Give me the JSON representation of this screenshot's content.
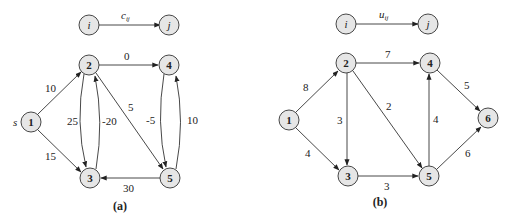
{
  "graph_a": {
    "caption": "(a)",
    "legend": {
      "from": "i",
      "to": "j",
      "label": "c",
      "sub": "ij"
    },
    "source_label": "s",
    "nodes": [
      {
        "id": "1",
        "x": 31,
        "y": 122
      },
      {
        "id": "2",
        "x": 89,
        "y": 65
      },
      {
        "id": "3",
        "x": 90,
        "y": 178
      },
      {
        "id": "4",
        "x": 169,
        "y": 65
      },
      {
        "id": "5",
        "x": 170,
        "y": 178
      }
    ],
    "edges": [
      {
        "from": "1",
        "to": "2",
        "label": "10"
      },
      {
        "from": "1",
        "to": "3",
        "label": "15"
      },
      {
        "from": "2",
        "to": "4",
        "label": "0"
      },
      {
        "from": "2",
        "to": "3",
        "label": "25"
      },
      {
        "from": "3",
        "to": "2",
        "label": "-20"
      },
      {
        "from": "2",
        "to": "5",
        "label": "5"
      },
      {
        "from": "4",
        "to": "5",
        "label": "-5"
      },
      {
        "from": "5",
        "to": "4",
        "label": "10"
      },
      {
        "from": "5",
        "to": "3",
        "label": "30"
      }
    ]
  },
  "graph_b": {
    "caption": "(b)",
    "legend": {
      "from": "i",
      "to": "j",
      "label": "u",
      "sub": "ij"
    },
    "nodes": [
      {
        "id": "1",
        "x": 289,
        "y": 120
      },
      {
        "id": "2",
        "x": 346,
        "y": 63
      },
      {
        "id": "3",
        "x": 348,
        "y": 176
      },
      {
        "id": "4",
        "x": 430,
        "y": 63
      },
      {
        "id": "5",
        "x": 429,
        "y": 176
      },
      {
        "id": "6",
        "x": 488,
        "y": 118
      }
    ],
    "edges": [
      {
        "from": "1",
        "to": "2",
        "label": "8"
      },
      {
        "from": "1",
        "to": "3",
        "label": "4"
      },
      {
        "from": "2",
        "to": "4",
        "label": "7"
      },
      {
        "from": "2",
        "to": "3",
        "label": "3"
      },
      {
        "from": "2",
        "to": "5",
        "label": "2"
      },
      {
        "from": "5",
        "to": "4",
        "label": "4"
      },
      {
        "from": "4",
        "to": "6",
        "label": "5"
      },
      {
        "from": "3",
        "to": "5",
        "label": "3"
      },
      {
        "from": "5",
        "to": "6",
        "label": "6"
      }
    ]
  }
}
